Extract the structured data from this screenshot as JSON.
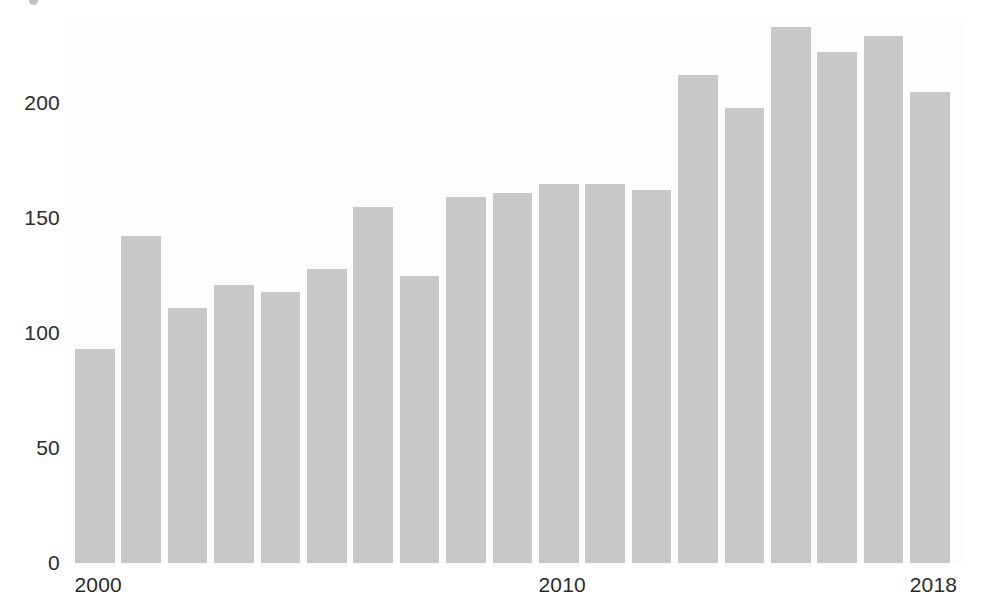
{
  "chart_data": {
    "type": "bar",
    "title": "",
    "subtitle": "",
    "xlabel": "",
    "ylabel": "",
    "categories": [
      "2000",
      "2001",
      "2002",
      "2003",
      "2004",
      "2005",
      "2006",
      "2007",
      "2008",
      "2009",
      "2010",
      "2011",
      "2012",
      "2013",
      "2014",
      "2015",
      "2016",
      "2017",
      "2018"
    ],
    "values": [
      93,
      142,
      111,
      121,
      118,
      128,
      155,
      125,
      159,
      161,
      165,
      165,
      162,
      212,
      198,
      233,
      222,
      229,
      205
    ],
    "xlim": [
      1999.5,
      2018.5
    ],
    "ylim": [
      0,
      240
    ],
    "ytick_labels": [
      "0",
      "50",
      "100",
      "150",
      "200"
    ],
    "ytick_values": [
      0,
      50,
      100,
      150,
      200
    ],
    "xtick_labels": [
      "2000",
      "2010",
      "2018"
    ],
    "xtick_values": [
      2000,
      2010,
      2018
    ],
    "grid": false,
    "legend": null,
    "legend_position": "none",
    "bar_color": "#c8c8c8",
    "axis_text_color": "#2b2b2b",
    "plot_background": "#fdfdfd",
    "page_background": "#ffffff",
    "annotations": []
  },
  "figure": {
    "plot_left_px": 70,
    "plot_top_px": 18,
    "plot_width_px": 895,
    "plot_height_px": 546,
    "baseline_y_px": 563,
    "px_per_unit": 2.3,
    "bar_first_left_px": 75,
    "bar_pitch_px": 46.4,
    "bar_width_px": 39.5
  }
}
